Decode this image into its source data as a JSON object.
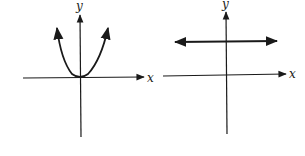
{
  "graphs": [
    {
      "name": "parabola-graph",
      "x_label": "x",
      "y_label": "y",
      "curve": "parabola opening upward, vertex at origin"
    },
    {
      "name": "horizontal-line-graph",
      "x_label": "x",
      "y_label": "y",
      "curve": "horizontal line above x-axis with arrows both ends"
    }
  ],
  "colors": {
    "stroke": "#1a1a1a",
    "background": "#ffffff"
  }
}
